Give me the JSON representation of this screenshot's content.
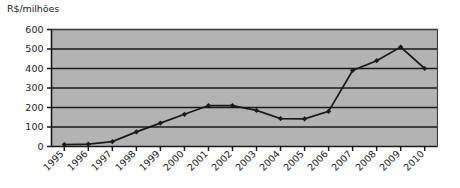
{
  "chart_data": {
    "type": "line",
    "title": "",
    "ylabel": "R$/milhões",
    "xlabel": "",
    "ylim": [
      0,
      600
    ],
    "yticks": [
      0,
      100,
      200,
      300,
      400,
      500,
      600
    ],
    "grid": true,
    "legend": "none",
    "marker": "diamond",
    "line_color": "#1a1a1a",
    "plot_background": "#b3b3b3",
    "gridline_color": "#1a1a1a",
    "categories": [
      "1995",
      "1996",
      "1997",
      "1998",
      "1999",
      "2000",
      "2001",
      "2002",
      "2003",
      "2004",
      "2005",
      "2006",
      "2007",
      "2008",
      "2009",
      "2010"
    ],
    "values": [
      10,
      12,
      25,
      75,
      120,
      165,
      210,
      210,
      185,
      143,
      142,
      180,
      390,
      440,
      510,
      400
    ],
    "xtick_rotation": 45
  }
}
